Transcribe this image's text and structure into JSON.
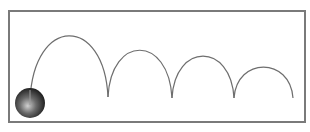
{
  "diagram": {
    "title": "",
    "frame": {
      "x": 9,
      "y": 11,
      "width": 296,
      "height": 111,
      "stroke": "#7a7a7a",
      "stroke_width": 2
    },
    "ball": {
      "cx": 30,
      "cy": 103,
      "r": 15,
      "highlight": "#bdbdbd",
      "shade": "#1a1a1a"
    },
    "trajectory": {
      "stroke": "#6e6e6e",
      "stroke_width": 1.2,
      "arcs": [
        {
          "start": [
            30,
            100
          ],
          "peak": [
            68,
            36
          ],
          "end": [
            108,
            97
          ]
        },
        {
          "start": [
            108,
            97
          ],
          "peak": [
            138,
            50
          ],
          "end": [
            172,
            98
          ]
        },
        {
          "start": [
            172,
            98
          ],
          "peak": [
            203,
            56
          ],
          "end": [
            234,
            98
          ]
        },
        {
          "start": [
            234,
            98
          ],
          "peak": [
            263,
            67
          ],
          "end": [
            293,
            98
          ]
        }
      ]
    }
  }
}
